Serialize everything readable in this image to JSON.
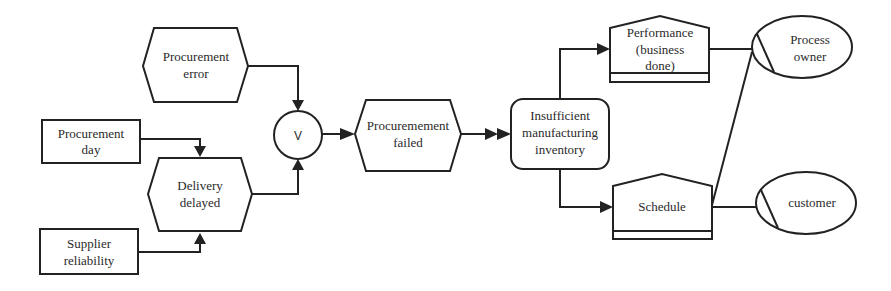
{
  "diagram": {
    "type": "event-driven process chain",
    "nodes": {
      "procurement_error": {
        "kind": "event",
        "lines": [
          "Procurement",
          "error"
        ]
      },
      "procurement_day": {
        "kind": "factor",
        "lines": [
          "Procurement",
          "day"
        ]
      },
      "delivery_delayed": {
        "kind": "event",
        "lines": [
          "Delivery",
          "delayed"
        ]
      },
      "supplier_reliability": {
        "kind": "factor",
        "lines": [
          "Supplier",
          "reliability"
        ]
      },
      "or_connector": {
        "kind": "connector",
        "label": "V"
      },
      "procurement_failed": {
        "kind": "event",
        "lines": [
          "Procuremement",
          "failed"
        ]
      },
      "insufficient_inventory": {
        "kind": "function",
        "lines": [
          "Insufficient",
          "manufacturing",
          "inventory"
        ]
      },
      "performance": {
        "kind": "document",
        "lines": [
          "Performance",
          "(business",
          "done)"
        ]
      },
      "schedule": {
        "kind": "document",
        "lines": [
          "Schedule"
        ]
      },
      "process_owner": {
        "kind": "role",
        "lines": [
          "Process",
          "owner"
        ]
      },
      "customer": {
        "kind": "role",
        "lines": [
          "customer"
        ]
      }
    },
    "edges": [
      {
        "from": "procurement_error",
        "to": "or_connector",
        "arrow": "single"
      },
      {
        "from": "delivery_delayed",
        "to": "or_connector",
        "arrow": "single"
      },
      {
        "from": "procurement_day",
        "to": "delivery_delayed",
        "arrow": "single"
      },
      {
        "from": "supplier_reliability",
        "to": "delivery_delayed",
        "arrow": "single"
      },
      {
        "from": "or_connector",
        "to": "procurement_failed",
        "arrow": "single"
      },
      {
        "from": "procurement_failed",
        "to": "insufficient_inventory",
        "arrow": "double"
      },
      {
        "from": "insufficient_inventory",
        "to": "performance",
        "arrow": "single"
      },
      {
        "from": "insufficient_inventory",
        "to": "schedule",
        "arrow": "single"
      },
      {
        "from": "performance",
        "to": "process_owner",
        "arrow": "none"
      },
      {
        "from": "schedule",
        "to": "process_owner",
        "arrow": "none"
      },
      {
        "from": "schedule",
        "to": "customer",
        "arrow": "none"
      }
    ]
  }
}
